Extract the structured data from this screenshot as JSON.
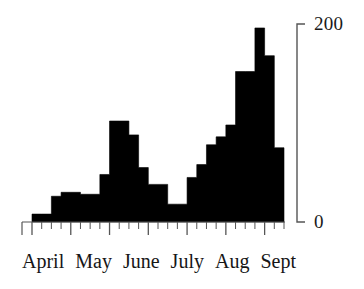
{
  "chart_data": {
    "type": "bar",
    "title": "",
    "subtitle": "",
    "xlabel": "",
    "ylabel": "",
    "ylim": [
      0,
      200
    ],
    "y_ticks": [
      0,
      200
    ],
    "y_tick_labels": [
      "0",
      "200"
    ],
    "grid": false,
    "legend": null,
    "bar_style": "contiguous-histogram",
    "bar_color": "#000000",
    "categories": [
      "April wk1",
      "April wk2",
      "April wk3",
      "April wk4",
      "May wk1",
      "May wk2",
      "May wk3",
      "May wk4",
      "June wk1",
      "June wk2",
      "June wk3",
      "June wk4",
      "July wk1",
      "July wk2",
      "July wk3",
      "July wk4",
      "Aug wk1",
      "Aug wk2",
      "Aug wk3",
      "Aug wk4",
      "Sept wk1",
      "Sept wk2",
      "Sept wk3",
      "Sept wk4",
      "Sept wk5",
      "Sept wk6"
    ],
    "values": [
      8,
      8,
      26,
      30,
      30,
      28,
      28,
      48,
      102,
      102,
      88,
      55,
      38,
      38,
      18,
      18,
      45,
      58,
      78,
      86,
      98,
      152,
      152,
      196,
      168,
      75
    ],
    "x_axis": {
      "month_labels": [
        "April",
        "May",
        "June",
        "July",
        "Aug",
        "Sept"
      ],
      "minor_tick_count": 26,
      "major_tick_count": 6
    },
    "annotations": []
  },
  "axis": {
    "y_top_label": "200",
    "y_bottom_label": "0"
  },
  "months": [
    {
      "label": "April"
    },
    {
      "label": "May"
    },
    {
      "label": "June"
    },
    {
      "label": "July"
    },
    {
      "label": "Aug"
    },
    {
      "label": "Sept"
    }
  ]
}
